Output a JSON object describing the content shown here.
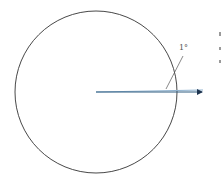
{
  "diagram": {
    "angle_label": "1°",
    "circle": {
      "cx": 96,
      "cy": 92,
      "r": 81,
      "stroke": "#333333"
    },
    "rays": {
      "origin": [
        96,
        92
      ],
      "horizontal_end": [
        203,
        92
      ],
      "angled_end": [
        203,
        90
      ],
      "color": "#2f5d80",
      "arrowhead": true
    },
    "leader_line": {
      "from": [
        183,
        56
      ],
      "to": [
        166,
        89
      ],
      "stroke": "#555555"
    },
    "colors": {
      "ray": "#2f5d80",
      "circle": "#333333",
      "leader": "#555555"
    }
  }
}
